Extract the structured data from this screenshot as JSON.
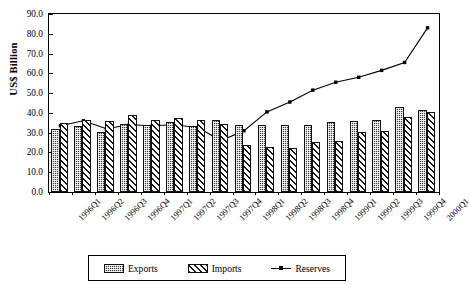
{
  "chart_data": {
    "type": "bar",
    "title": "",
    "xlabel": "",
    "ylabel": "US$ Billion",
    "ylim": [
      0,
      90
    ],
    "ytick_step": 10,
    "ytick_labels": [
      "0.0",
      "10.0",
      "20.0",
      "30.0",
      "40.0",
      "50.0",
      "60.0",
      "70.0",
      "80.0",
      "90.0"
    ],
    "grid": false,
    "legend_position": "bottom",
    "categories": [
      "1996Q1",
      "1996Q2",
      "1996Q3",
      "1996Q4",
      "1997Q1",
      "1997Q2",
      "1997Q3",
      "1997Q4",
      "1998Q1",
      "1998Q2",
      "1998Q3",
      "1998Q4",
      "1999Q1",
      "1999Q2",
      "1999Q3",
      "1999Q4",
      "2000Q1"
    ],
    "series": [
      {
        "name": "Exports",
        "kind": "bar",
        "values": [
          32.0,
          33.5,
          30.5,
          34.5,
          34.0,
          35.5,
          33.5,
          36.5,
          34.0,
          34.0,
          34.0,
          34.0,
          35.5,
          36.0,
          36.5,
          43.0,
          41.5
        ]
      },
      {
        "name": "Imports",
        "kind": "bar",
        "values": [
          35.0,
          36.5,
          36.0,
          39.0,
          36.5,
          37.5,
          36.5,
          34.5,
          24.0,
          23.0,
          22.5,
          25.5,
          26.0,
          30.5,
          31.0,
          38.0,
          40.5
        ]
      },
      {
        "name": "Reserves",
        "kind": "line",
        "marker": "square",
        "values": [
          33.5,
          36.0,
          32.0,
          34.0,
          33.5,
          34.0,
          32.5,
          26.0,
          31.0,
          40.5,
          45.5,
          51.5,
          55.5,
          58.0,
          61.5,
          65.5,
          83.0
        ]
      }
    ]
  },
  "legend": {
    "items": [
      {
        "label": "Exports",
        "swatch": "checkered-fill"
      },
      {
        "label": "Imports",
        "swatch": "diagonal-hatch-fill"
      },
      {
        "label": "Reserves",
        "swatch": "line-with-square-marker"
      }
    ]
  }
}
